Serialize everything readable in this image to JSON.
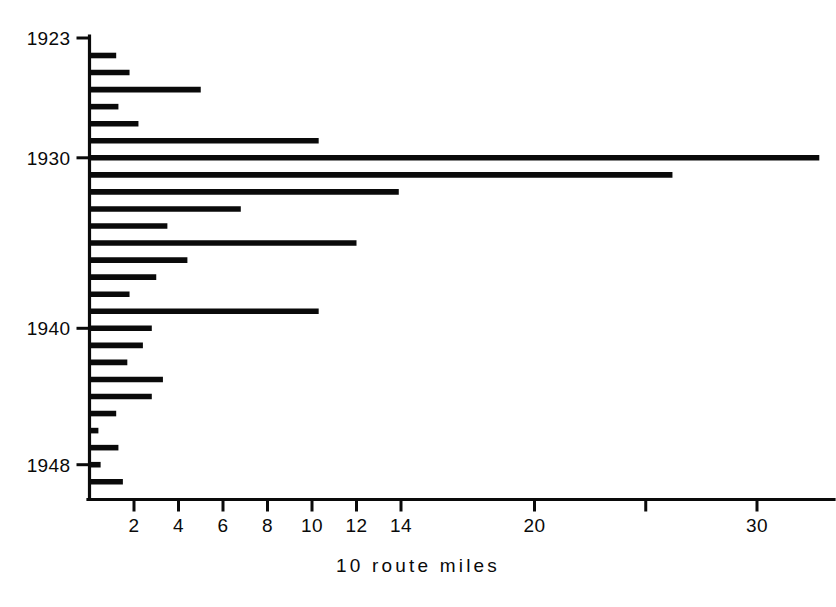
{
  "chart_data": {
    "type": "bar",
    "orientation": "horizontal",
    "title": "",
    "subtitle": "",
    "xlabel": "10 route miles",
    "ylabel": "",
    "xlim": [
      0,
      33.5
    ],
    "ylim_categories_top_to_bottom": true,
    "grid": false,
    "legend": null,
    "x_ticks": [
      {
        "value": 2,
        "label": "2"
      },
      {
        "value": 4,
        "label": "4"
      },
      {
        "value": 6,
        "label": "6"
      },
      {
        "value": 8,
        "label": "8"
      },
      {
        "value": 10,
        "label": "10"
      },
      {
        "value": 12,
        "label": "12"
      },
      {
        "value": 14,
        "label": "14"
      },
      {
        "value": 20,
        "label": "20"
      },
      {
        "value": 25,
        "label": ""
      },
      {
        "value": 30,
        "label": "30"
      }
    ],
    "y_ticks": [
      {
        "category": "1923",
        "label": "1923"
      },
      {
        "category": "1930",
        "label": "1930"
      },
      {
        "category": "1940",
        "label": "1940"
      },
      {
        "category": "1948",
        "label": "1948"
      }
    ],
    "categories": [
      "1923",
      "1924",
      "1925",
      "1926",
      "1927",
      "1928",
      "1929",
      "1930",
      "1931",
      "1932",
      "1933",
      "1934",
      "1935",
      "1936",
      "1937",
      "1938",
      "1939",
      "1940",
      "1941",
      "1942",
      "1943",
      "1944",
      "1945",
      "1946",
      "1947",
      "1948",
      "1949"
    ],
    "values": [
      0.0,
      1.2,
      1.8,
      5.0,
      1.3,
      2.2,
      10.3,
      32.8,
      26.2,
      13.9,
      6.8,
      3.5,
      12.0,
      4.4,
      3.0,
      1.8,
      10.3,
      2.8,
      2.4,
      1.7,
      3.3,
      2.8,
      1.2,
      0.4,
      1.3,
      0.5,
      1.5
    ],
    "series": [
      {
        "name": "route miles",
        "values": [
          0.0,
          1.2,
          1.8,
          5.0,
          1.3,
          2.2,
          10.3,
          32.8,
          26.2,
          13.9,
          6.8,
          3.5,
          12.0,
          4.4,
          3.0,
          1.8,
          10.3,
          2.8,
          2.4,
          1.7,
          3.3,
          2.8,
          1.2,
          0.4,
          1.3,
          0.5,
          1.5
        ]
      }
    ],
    "colors": {
      "bar": "#0a0a0a",
      "axis": "#0a0a0a",
      "background": "#ffffff"
    }
  },
  "axis": {
    "x_title": "10 route miles"
  }
}
